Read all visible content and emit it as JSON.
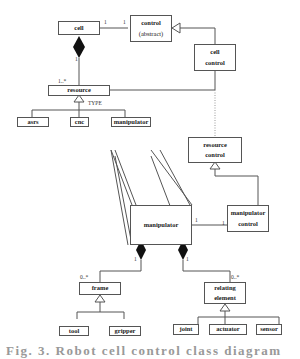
{
  "diagram": {
    "classes": {
      "cell": {
        "label": "cell"
      },
      "control": {
        "line1": "control",
        "line2": "(abstract)"
      },
      "cell_control": {
        "line1": "cell",
        "line2": "control"
      },
      "resource": {
        "label": "resource"
      },
      "asrs": {
        "label": "asrs"
      },
      "cnc": {
        "label": "cnc"
      },
      "manipulator_small": {
        "label": "manipulator"
      },
      "manipulator_big": {
        "label": "manipulator"
      },
      "resource_control": {
        "line1": "resource",
        "line2": "control"
      },
      "manipulator_control": {
        "line1": "manipulator",
        "line2": "control"
      },
      "frame": {
        "label": "frame"
      },
      "tool": {
        "label": "tool"
      },
      "gripper": {
        "label": "gripper"
      },
      "relating_element": {
        "line1": "relating",
        "line2": "element"
      },
      "joint": {
        "label": "joint"
      },
      "actuator": {
        "label": "actuator"
      },
      "sensor": {
        "label": "sensor"
      }
    },
    "labels": {
      "type": "TYPE",
      "cell_control_left": "1",
      "cell_control_right": "1",
      "cell_comp": "1",
      "resource_mult": "1..*",
      "manip_ctrl_left": "1",
      "manip_ctrl_right": "1",
      "frame_comp": "1",
      "frame_mult": "0..*",
      "rel_comp": "1",
      "rel_mult": "0..*"
    },
    "caption": "Fig. 3. Robot cell control class diagram"
  }
}
